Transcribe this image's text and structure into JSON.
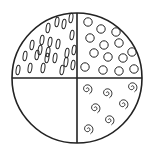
{
  "diagram": {
    "type": "partitioned-circle",
    "stroke_color": "#222222",
    "background": "#ffffff",
    "circle": {
      "cx": 77,
      "cy": 78,
      "r": 65
    },
    "quadrants": [
      {
        "position": "top-left",
        "pattern": "ovals",
        "items": [
          [
            71,
            18
          ],
          [
            57,
            22
          ],
          [
            48,
            28
          ],
          [
            64,
            24
          ],
          [
            72,
            35
          ],
          [
            42,
            40
          ],
          [
            50,
            42
          ],
          [
            58,
            44
          ],
          [
            32,
            45
          ],
          [
            40,
            50
          ],
          [
            48,
            52
          ],
          [
            67,
            53
          ],
          [
            74,
            50
          ],
          [
            25,
            56
          ],
          [
            37,
            55
          ],
          [
            47,
            58
          ],
          [
            55,
            58
          ],
          [
            66,
            62
          ],
          [
            18,
            70
          ],
          [
            30,
            68
          ],
          [
            43,
            68
          ],
          [
            62,
            70
          ],
          [
            73,
            65
          ]
        ]
      },
      {
        "position": "top-right",
        "pattern": "circles",
        "items": [
          [
            88,
            22
          ],
          [
            101,
            29
          ],
          [
            116,
            32
          ],
          [
            90,
            38
          ],
          [
            104,
            45
          ],
          [
            119,
            43
          ],
          [
            94,
            53
          ],
          [
            108,
            57
          ],
          [
            123,
            58
          ],
          [
            132,
            52
          ],
          [
            85,
            67
          ],
          [
            103,
            70
          ],
          [
            119,
            71
          ],
          [
            134,
            69
          ]
        ]
      },
      {
        "position": "bottom-left",
        "pattern": "empty",
        "items": []
      },
      {
        "position": "bottom-right",
        "pattern": "spirals",
        "items": [
          [
            87,
            89
          ],
          [
            107,
            93
          ],
          [
            132,
            87
          ],
          [
            95,
            108
          ],
          [
            123,
            104
          ],
          [
            109,
            120
          ],
          [
            88,
            129
          ]
        ]
      }
    ]
  }
}
